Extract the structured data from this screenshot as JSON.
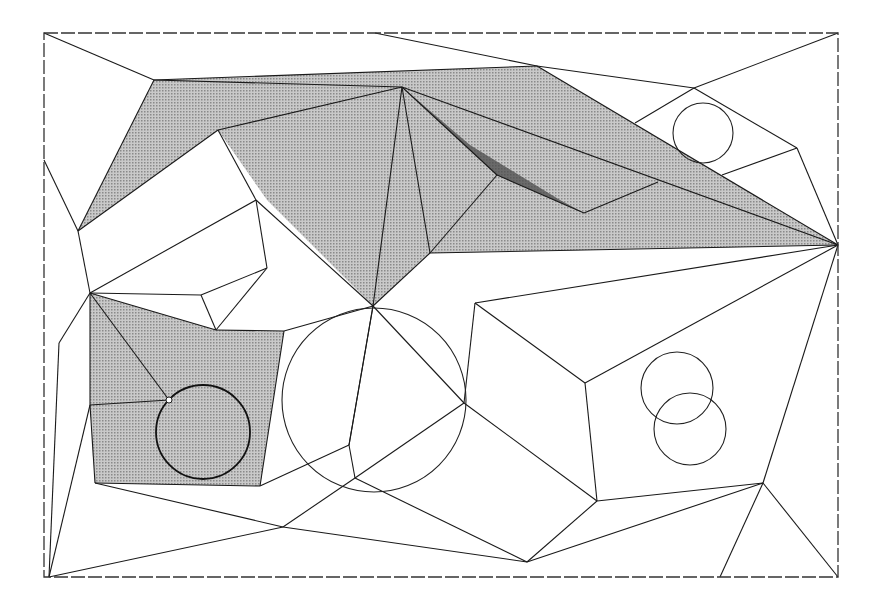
{
  "figure": {
    "colors": {
      "background": "#ffffff",
      "line": "#1a1a1a",
      "shade": "#b5b5b5",
      "shade_dark": "#4a4a4a"
    },
    "frame": {
      "x1": 44,
      "y1": 33,
      "x2": 838,
      "y2": 577,
      "style": "dashed"
    },
    "shaded_regions": [
      {
        "name": "upper-corridor",
        "points": "154,80 537,66 838,245 430,253 373,306 267,200 218,130 78,231"
      },
      {
        "name": "lower-left-pocket",
        "points": "90,293 216,330 284,331 260,486 95,483 90,405"
      }
    ],
    "dark_sliver": {
      "points": "402,87 497,175 584,213 560,200 470,145"
    },
    "circles": [
      {
        "name": "circle-in-pocket",
        "cx": 203,
        "cy": 432,
        "r": 47,
        "heavy": true
      },
      {
        "name": "large-center-circle",
        "cx": 374,
        "cy": 400,
        "r": 92,
        "heavy": false
      },
      {
        "name": "upper-right-circle",
        "cx": 703,
        "cy": 133,
        "r": 30,
        "heavy": false
      },
      {
        "name": "overlap-circle-a",
        "cx": 677,
        "cy": 388,
        "r": 36,
        "heavy": false
      },
      {
        "name": "overlap-circle-b",
        "cx": 690,
        "cy": 429,
        "r": 36,
        "heavy": false
      }
    ],
    "nodes": [
      {
        "name": "open-node",
        "cx": 169,
        "cy": 400,
        "r": 3
      }
    ],
    "edges": [
      [
        44,
        33,
        154,
        80
      ],
      [
        154,
        80,
        537,
        66
      ],
      [
        375,
        33,
        537,
        66
      ],
      [
        537,
        66,
        694,
        88
      ],
      [
        694,
        88,
        838,
        33
      ],
      [
        694,
        88,
        797,
        148
      ],
      [
        797,
        148,
        838,
        245
      ],
      [
        694,
        88,
        635,
        123
      ],
      [
        797,
        148,
        722,
        175
      ],
      [
        537,
        66,
        838,
        245
      ],
      [
        154,
        80,
        402,
        87
      ],
      [
        154,
        80,
        78,
        231
      ],
      [
        78,
        231,
        44,
        160
      ],
      [
        402,
        87,
        218,
        130
      ],
      [
        218,
        130,
        78,
        231
      ],
      [
        218,
        130,
        256,
        200
      ],
      [
        256,
        200,
        373,
        306
      ],
      [
        402,
        87,
        373,
        306
      ],
      [
        402,
        87,
        430,
        253
      ],
      [
        402,
        87,
        497,
        175
      ],
      [
        402,
        87,
        838,
        245
      ],
      [
        497,
        175,
        584,
        213
      ],
      [
        584,
        213,
        658,
        182
      ],
      [
        497,
        175,
        430,
        253
      ],
      [
        430,
        253,
        838,
        245
      ],
      [
        430,
        253,
        373,
        306
      ],
      [
        78,
        231,
        90,
        293
      ],
      [
        90,
        293,
        256,
        200
      ],
      [
        256,
        200,
        267,
        268
      ],
      [
        267,
        268,
        201,
        295
      ],
      [
        201,
        295,
        90,
        293
      ],
      [
        201,
        295,
        216,
        330
      ],
      [
        216,
        330,
        267,
        268
      ],
      [
        90,
        293,
        216,
        330
      ],
      [
        216,
        330,
        284,
        331
      ],
      [
        284,
        331,
        373,
        306
      ],
      [
        90,
        293,
        169,
        400
      ],
      [
        90,
        293,
        90,
        405
      ],
      [
        90,
        405,
        169,
        400
      ],
      [
        90,
        293,
        59,
        343
      ],
      [
        59,
        343,
        49,
        577
      ],
      [
        90,
        405,
        49,
        577
      ],
      [
        284,
        331,
        260,
        486
      ],
      [
        260,
        486,
        95,
        483
      ],
      [
        95,
        483,
        90,
        405
      ],
      [
        95,
        483,
        283,
        527
      ],
      [
        260,
        486,
        349,
        445
      ],
      [
        349,
        445,
        373,
        306
      ],
      [
        349,
        445,
        355,
        478
      ],
      [
        355,
        478,
        464,
        403
      ],
      [
        373,
        306,
        464,
        403
      ],
      [
        464,
        403,
        475,
        303
      ],
      [
        475,
        303,
        838,
        245
      ],
      [
        475,
        303,
        585,
        383
      ],
      [
        585,
        383,
        838,
        245
      ],
      [
        585,
        383,
        597,
        501
      ],
      [
        597,
        501,
        763,
        483
      ],
      [
        763,
        483,
        838,
        245
      ],
      [
        763,
        483,
        838,
        577
      ],
      [
        763,
        483,
        720,
        577
      ],
      [
        763,
        483,
        527,
        562
      ],
      [
        597,
        501,
        527,
        562
      ],
      [
        464,
        403,
        597,
        501
      ],
      [
        355,
        478,
        527,
        562
      ],
      [
        355,
        478,
        283,
        527
      ],
      [
        283,
        527,
        527,
        562
      ],
      [
        283,
        527,
        49,
        577
      ],
      [
        373,
        306,
        349,
        445
      ]
    ]
  }
}
